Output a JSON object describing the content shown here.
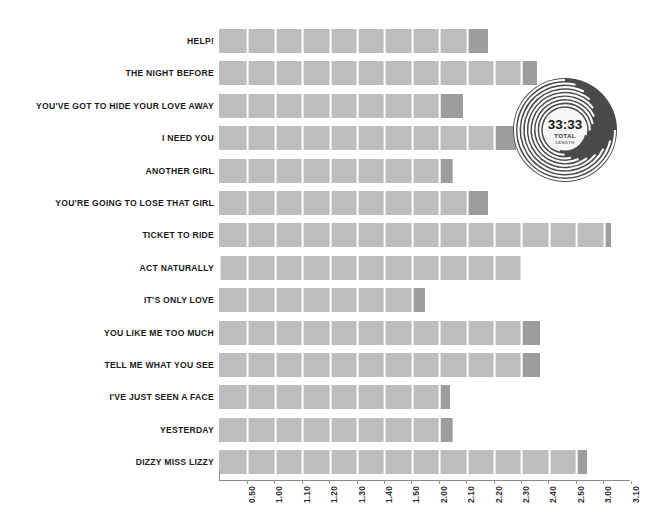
{
  "chart_data": {
    "type": "bar",
    "orientation": "horizontal",
    "title": "",
    "subtitle": "",
    "xlabel": "",
    "ylabel": "",
    "grid": true,
    "grid_orientation": "vertical",
    "legend": "none",
    "axis_range_labels": [
      "0.50",
      "3.10"
    ],
    "tick_labels": [
      "0.50",
      "1.00",
      "1.10",
      "1.20",
      "1.30",
      "1.40",
      "1.50",
      "2.00",
      "2.10",
      "2.20",
      "2.30",
      "2.40",
      "2.50",
      "3.00",
      "3.10"
    ],
    "tick_values_seconds": [
      50,
      60,
      70,
      80,
      90,
      100,
      110,
      120,
      130,
      140,
      150,
      160,
      170,
      180,
      190
    ],
    "categories": [
      "HELP!",
      "THE NIGHT BEFORE",
      "YOU'VE GOT TO HIDE YOUR LOVE AWAY",
      "I NEED YOU",
      "ANOTHER GIRL",
      "YOU'RE GOING TO LOSE THAT GIRL",
      "TICKET TO RIDE",
      "ACT NATURALLY",
      "IT'S ONLY LOVE",
      "YOU LIKE ME TOO MUCH",
      "TELL ME WHAT YOU SEE",
      "I'VE JUST SEEN A FACE",
      "YESTERDAY",
      "DIZZY MISS LIZZY"
    ],
    "values": [
      138,
      156,
      129,
      148,
      125,
      138,
      183,
      150,
      115,
      157,
      157,
      124,
      125,
      174
    ],
    "value_labels": [
      "2.18",
      "2.36",
      "2.09",
      "2.28",
      "2.05",
      "2.18",
      "3.03",
      "2.30",
      "1.55",
      "2.37",
      "2.37",
      "2.04",
      "2.05",
      "2.54"
    ],
    "bar_color": "#bdbdbd",
    "bar_tail_color": "#9d9d9d",
    "segment_separator_color": "#ffffff",
    "axis_color": "#8a8a8a",
    "label_color": "#1a1a1a"
  },
  "badge": {
    "name": "vinyl-record",
    "total_time": "33:33",
    "caption_line1": "TOTAL",
    "caption_line2": "LENGTH",
    "disc_color": "#4a4a4a",
    "groove_color": "#ffffff",
    "label_color": "#f7f7f7"
  }
}
